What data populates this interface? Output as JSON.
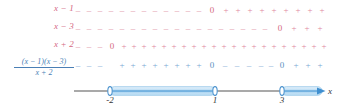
{
  "diagram": {
    "kind": "sign-chart",
    "title_expression": "(x-1)(x-3)/(x+2)",
    "axis_variable": "x",
    "colors": {
      "factor_label": "#d4677f",
      "factor_sign": "#e08aa0",
      "quotient_label": "#4a7fb5",
      "quotient_sign": "#7aa8d4",
      "axis": "#555555",
      "highlight": "#8fc4e8",
      "highlight_fill": "#bcdef5"
    },
    "critical_points": [
      {
        "value": "-2",
        "x": 110
      },
      {
        "value": "1",
        "x": 215
      },
      {
        "value": "3",
        "x": 282
      }
    ],
    "rows": [
      {
        "name": "row-x-minus-1",
        "label": "x − 1",
        "label_kind": "plain",
        "color_class": "red",
        "y": 8,
        "signs": [
          {
            "t": "–",
            "x": 78
          },
          {
            "t": "–",
            "x": 89
          },
          {
            "t": "–",
            "x": 100
          },
          {
            "t": "–",
            "x": 111
          },
          {
            "t": "–",
            "x": 122
          },
          {
            "t": "–",
            "x": 133
          },
          {
            "t": "–",
            "x": 144
          },
          {
            "t": "–",
            "x": 155
          },
          {
            "t": "–",
            "x": 166
          },
          {
            "t": "–",
            "x": 177
          },
          {
            "t": "–",
            "x": 188
          },
          {
            "t": "–",
            "x": 199
          },
          {
            "t": "0",
            "x": 212,
            "zero": true
          },
          {
            "t": "+",
            "x": 226
          },
          {
            "t": "+",
            "x": 238
          },
          {
            "t": "+",
            "x": 250
          },
          {
            "t": "+",
            "x": 262
          },
          {
            "t": "+",
            "x": 274
          },
          {
            "t": "+",
            "x": 286
          },
          {
            "t": "+",
            "x": 298
          },
          {
            "t": "+",
            "x": 310
          },
          {
            "t": "+",
            "x": 322
          }
        ]
      },
      {
        "name": "row-x-minus-3",
        "label": "x − 3",
        "label_kind": "plain",
        "color_class": "red",
        "y": 26,
        "signs": [
          {
            "t": "–",
            "x": 78
          },
          {
            "t": "–",
            "x": 89
          },
          {
            "t": "–",
            "x": 100
          },
          {
            "t": "–",
            "x": 111
          },
          {
            "t": "–",
            "x": 122
          },
          {
            "t": "–",
            "x": 133
          },
          {
            "t": "–",
            "x": 144
          },
          {
            "t": "–",
            "x": 155
          },
          {
            "t": "–",
            "x": 166
          },
          {
            "t": "–",
            "x": 177
          },
          {
            "t": "–",
            "x": 188
          },
          {
            "t": "–",
            "x": 199
          },
          {
            "t": "–",
            "x": 210
          },
          {
            "t": "–",
            "x": 221
          },
          {
            "t": "–",
            "x": 232
          },
          {
            "t": "–",
            "x": 243
          },
          {
            "t": "–",
            "x": 254
          },
          {
            "t": "–",
            "x": 265
          },
          {
            "t": "0",
            "x": 280,
            "zero": true
          },
          {
            "t": "+",
            "x": 294
          },
          {
            "t": "+",
            "x": 307
          },
          {
            "t": "+",
            "x": 320
          }
        ]
      },
      {
        "name": "row-x-plus-2",
        "label": "x + 2",
        "label_kind": "plain",
        "color_class": "red",
        "y": 44,
        "signs": [
          {
            "t": "–",
            "x": 78
          },
          {
            "t": "–",
            "x": 89
          },
          {
            "t": "–",
            "x": 100
          },
          {
            "t": "0",
            "x": 112,
            "zero": true
          },
          {
            "t": "+",
            "x": 124
          },
          {
            "t": "+",
            "x": 134
          },
          {
            "t": "+",
            "x": 144
          },
          {
            "t": "+",
            "x": 154
          },
          {
            "t": "+",
            "x": 164
          },
          {
            "t": "+",
            "x": 174
          },
          {
            "t": "+",
            "x": 184
          },
          {
            "t": "+",
            "x": 194
          },
          {
            "t": "+",
            "x": 204
          },
          {
            "t": "+",
            "x": 214
          },
          {
            "t": "+",
            "x": 224
          },
          {
            "t": "+",
            "x": 234
          },
          {
            "t": "+",
            "x": 244
          },
          {
            "t": "+",
            "x": 254
          },
          {
            "t": "+",
            "x": 264
          },
          {
            "t": "+",
            "x": 274
          },
          {
            "t": "+",
            "x": 284
          },
          {
            "t": "+",
            "x": 294
          },
          {
            "t": "+",
            "x": 304
          },
          {
            "t": "+",
            "x": 314
          },
          {
            "t": "+",
            "x": 324
          }
        ]
      },
      {
        "name": "row-quotient",
        "label": "(x − 1)(x − 3) / (x + 2)",
        "label_kind": "fraction",
        "numerator": "(x − 1)(x − 3)",
        "denominator": "x + 2",
        "color_class": "blue",
        "y": 63,
        "signs": [
          {
            "t": "–",
            "x": 78
          },
          {
            "t": "–",
            "x": 89
          },
          {
            "t": "–",
            "x": 100
          },
          {
            "t": "+",
            "x": 122
          },
          {
            "t": "+",
            "x": 133
          },
          {
            "t": "+",
            "x": 144
          },
          {
            "t": "+",
            "x": 155
          },
          {
            "t": "+",
            "x": 166
          },
          {
            "t": "+",
            "x": 177
          },
          {
            "t": "+",
            "x": 188
          },
          {
            "t": "+",
            "x": 199
          },
          {
            "t": "0",
            "x": 212,
            "zero": true
          },
          {
            "t": "–",
            "x": 225
          },
          {
            "t": "–",
            "x": 237
          },
          {
            "t": "–",
            "x": 249
          },
          {
            "t": "–",
            "x": 261
          },
          {
            "t": "–",
            "x": 271
          },
          {
            "t": "0",
            "x": 282,
            "zero": true
          },
          {
            "t": "+",
            "x": 296
          },
          {
            "t": "+",
            "x": 308
          },
          {
            "t": "+",
            "x": 320
          }
        ]
      }
    ],
    "axis": {
      "line_start": 74,
      "line_end": 322,
      "y": 91,
      "arrow_label": "x",
      "arrow_label_x": 328,
      "segments": [
        {
          "name": "segment-minus2-to-1",
          "from": 110,
          "to": 215,
          "open_left": true,
          "open_right": true,
          "arrow": false
        },
        {
          "name": "segment-3-to-infinity",
          "from": 282,
          "to": 322,
          "open_left": true,
          "open_right": false,
          "arrow": true
        }
      ]
    }
  }
}
